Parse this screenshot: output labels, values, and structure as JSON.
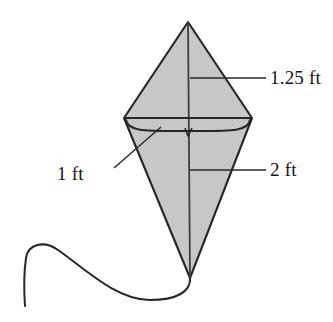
{
  "figure": {
    "name": "kite-diagram",
    "background_color": "#ffffff"
  },
  "kite": {
    "fill_color": "#c9c9c9",
    "outline_color": "#272727",
    "spine_color": "#3a3a3a",
    "vertices": {
      "top": [
        188,
        22
      ],
      "left": [
        124,
        118
      ],
      "right": [
        252,
        118
      ],
      "bottom": [
        190,
        278
      ]
    },
    "crossbar_y": 118,
    "bowed_spar_sag_y": 132
  },
  "tail": {
    "color": "#272727",
    "start": [
      190,
      278
    ],
    "end": [
      25,
      306
    ]
  },
  "labels": {
    "upper_right": {
      "text": "1.25 ft",
      "tick_y": 78,
      "tick_x_start": 190,
      "tick_x_end": 266
    },
    "lower_right": {
      "text": "2 ft",
      "tick_y": 170,
      "tick_x_start": 190,
      "tick_x_end": 266
    },
    "left": {
      "text": "1 ft",
      "leader_from": [
        114,
        168
      ],
      "leader_to": [
        161,
        127
      ]
    }
  },
  "colors": {
    "ink": "#141414",
    "shade": "#c9c9c9",
    "line": "#272727"
  }
}
